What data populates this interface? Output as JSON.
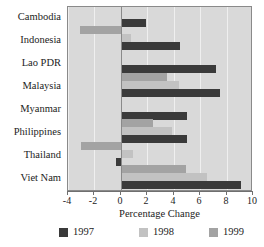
{
  "chart_data": {
    "type": "bar",
    "orientation": "horizontal",
    "title": "",
    "xlabel": "Percentage Change",
    "ylabel": "",
    "xlim": [
      -4,
      10
    ],
    "xticks": [
      "-4",
      "-2",
      "0",
      "2",
      "4",
      "6",
      "8",
      "10"
    ],
    "xtick_values": [
      -4,
      -2,
      0,
      2,
      4,
      6,
      8,
      10
    ],
    "grid": true,
    "grid_axis": "x",
    "legend_position": "bottom",
    "categories": [
      "Cambodia",
      "Indonesia",
      "Lao PDR",
      "Malaysia",
      "Myanmar",
      "Philippines",
      "Thailand",
      "Viet Nam"
    ],
    "series": [
      {
        "name": "1997",
        "color": "#3a3a3a",
        "values": [
          1.9,
          4.5,
          7.2,
          7.5,
          5.0,
          5.0,
          -0.4,
          9.1
        ]
      },
      {
        "name": "1998",
        "color": "#c2c2c2",
        "values": [
          null,
          0.8,
          null,
          4.4,
          null,
          3.9,
          0.9,
          6.5
        ]
      },
      {
        "name": "1999",
        "color": "#a3a3a3",
        "values": [
          null,
          -3.1,
          null,
          3.5,
          null,
          2.4,
          -3.0,
          4.9
        ]
      }
    ]
  },
  "legend": {
    "items": [
      {
        "label": "1997",
        "color": "#3a3a3a"
      },
      {
        "label": "1998",
        "color": "#c2c2c2"
      },
      {
        "label": "1999",
        "color": "#a3a3a3"
      }
    ]
  },
  "axis": {
    "x_title": "Percentage Change"
  },
  "colors": {
    "plot_background": "#d9d9d9",
    "plot_border": "#8a8a8a",
    "gridline": "#efefef",
    "zero_line": "#8a8a8a",
    "text": "#1c1c1c",
    "series_1997": "#3a3a3a",
    "series_1998": "#c2c2c2",
    "series_1999": "#a3a3a3"
  }
}
